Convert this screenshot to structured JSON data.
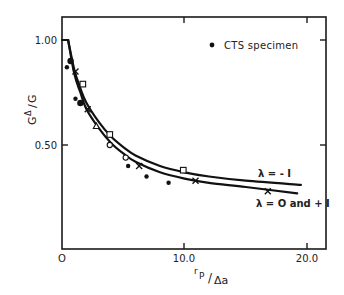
{
  "chart_data": {
    "type": "line",
    "title": "",
    "xlabel": "r_p/Δa",
    "ylabel": "G^Δ/G",
    "xlim": [
      0,
      22
    ],
    "ylim": [
      0,
      1.1
    ],
    "grid": false,
    "x_ticks": [
      {
        "value": 0,
        "label": "O"
      },
      {
        "value": 10,
        "label": "10.0"
      },
      {
        "value": 20,
        "label": "20.0"
      }
    ],
    "y_ticks": [
      {
        "value": 0.5,
        "label": "0.50"
      },
      {
        "value": 1.0,
        "label": "1.00"
      }
    ],
    "legend": {
      "position": "upper right",
      "entries": [
        {
          "marker": "filled-dot",
          "label": "CTS specimen"
        }
      ]
    },
    "series": [
      {
        "name": "λ = -1",
        "style": "solid-line",
        "x": [
          0,
          0.5,
          1.0,
          1.5,
          2.0,
          3.0,
          4.0,
          5.0,
          6.0,
          8.0,
          10.0,
          12.0,
          15.0,
          19.5
        ],
        "y": [
          1.0,
          1.0,
          0.86,
          0.77,
          0.7,
          0.61,
          0.54,
          0.49,
          0.45,
          0.4,
          0.37,
          0.35,
          0.33,
          0.31
        ]
      },
      {
        "name": "λ = O and + 1",
        "style": "solid-line",
        "x": [
          0,
          0.5,
          1.0,
          1.5,
          2.0,
          3.0,
          4.0,
          5.0,
          6.0,
          8.0,
          10.0,
          12.0,
          15.0,
          19.2
        ],
        "y": [
          1.0,
          1.0,
          0.84,
          0.75,
          0.67,
          0.58,
          0.51,
          0.46,
          0.42,
          0.37,
          0.34,
          0.32,
          0.3,
          0.27
        ]
      },
      {
        "name": "CTS specimen",
        "style": "filled-dot",
        "x": [
          0.7,
          0.4,
          1.1,
          1.5,
          5.4,
          6.9,
          8.7
        ],
        "y": [
          0.9,
          0.87,
          0.72,
          0.7,
          0.4,
          0.35,
          0.32
        ],
        "sizes": [
          3.2,
          2.2,
          2.2,
          3.2,
          2.2,
          2.2,
          2.2
        ]
      },
      {
        "name": "x-markers (λ = O and + 1)",
        "style": "x-marker",
        "x": [
          1.1,
          2.1,
          6.3,
          10.9,
          16.8
        ],
        "y": [
          0.85,
          0.67,
          0.4,
          0.33,
          0.28
        ]
      },
      {
        "name": "square-markers (λ = -1)",
        "style": "open-square",
        "x": [
          1.7,
          3.9,
          9.9
        ],
        "y": [
          0.79,
          0.55,
          0.38
        ]
      },
      {
        "name": "triangle-markers",
        "style": "open-triangle",
        "x": [
          2.8
        ],
        "y": [
          0.59
        ]
      },
      {
        "name": "circle-markers",
        "style": "open-circle",
        "x": [
          3.9,
          5.2
        ],
        "y": [
          0.5,
          0.44
        ]
      }
    ],
    "annotations": [
      {
        "text": "λ = - I",
        "x": 15.5,
        "y": 0.35,
        "refers_to": "λ = -1"
      },
      {
        "text": "λ = O and + I",
        "x": 15.5,
        "y": 0.23,
        "refers_to": "λ = O and + 1"
      }
    ]
  },
  "labels": {
    "y_axis_num": "G",
    "y_axis_sup": "Δ",
    "y_axis_den": "G",
    "x_axis_num": "r",
    "x_axis_sub": "P",
    "x_axis_den": "Δa",
    "legend_text": "CTS specimen",
    "anno_lambda_minus": "λ = - I",
    "anno_lambda_zero": "λ = O and + I",
    "tick_x0": "O",
    "tick_x10": "10.0",
    "tick_x20": "20.0",
    "tick_y050": "0.50",
    "tick_y100": "1.00"
  }
}
